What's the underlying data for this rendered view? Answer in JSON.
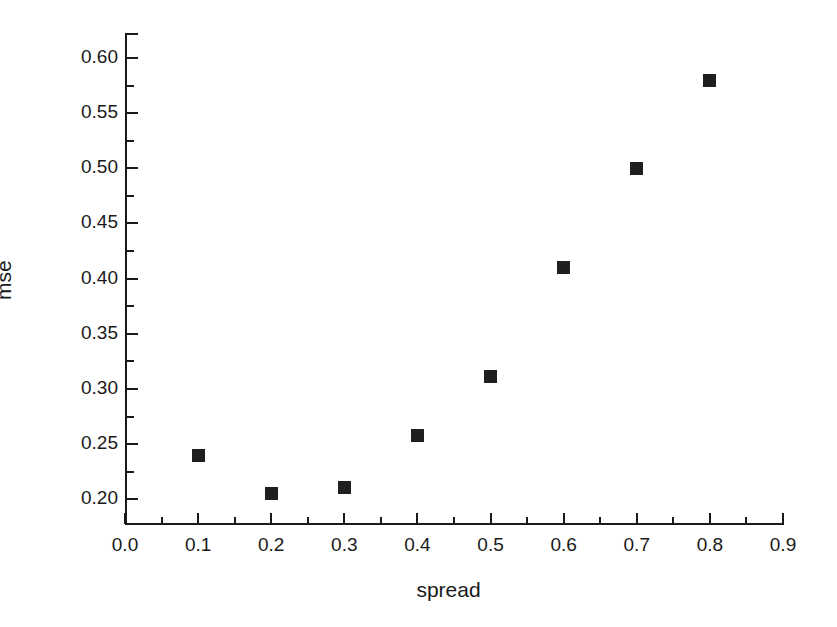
{
  "chart_data": {
    "type": "scatter",
    "title": "",
    "xlabel": "spread",
    "ylabel": "mse",
    "x": [
      0.1,
      0.2,
      0.3,
      0.4,
      0.5,
      0.6,
      0.7,
      0.8
    ],
    "values": [
      0.24,
      0.205,
      0.211,
      0.258,
      0.311,
      0.41,
      0.5,
      0.58
    ],
    "series": [
      {
        "name": "mse",
        "points": [
          {
            "x": 0.1,
            "y": 0.24
          },
          {
            "x": 0.2,
            "y": 0.205
          },
          {
            "x": 0.3,
            "y": 0.211
          },
          {
            "x": 0.4,
            "y": 0.258
          },
          {
            "x": 0.5,
            "y": 0.311
          },
          {
            "x": 0.6,
            "y": 0.41
          },
          {
            "x": 0.7,
            "y": 0.5
          },
          {
            "x": 0.8,
            "y": 0.58
          }
        ],
        "marker": "filled-square",
        "color": "#1f1f1f"
      }
    ],
    "xlim": [
      0.0,
      0.9
    ],
    "ylim": [
      0.1777,
      0.6226
    ],
    "xticks": [
      0.0,
      0.1,
      0.2,
      0.3,
      0.4,
      0.5,
      0.6,
      0.7,
      0.8,
      0.9
    ],
    "xticklabels": [
      "0.0",
      "0.1",
      "0.2",
      "0.3",
      "0.4",
      "0.5",
      "0.6",
      "0.7",
      "0.8",
      "0.9"
    ],
    "xminorticks": [
      0.05,
      0.15,
      0.25,
      0.35,
      0.45,
      0.55,
      0.65,
      0.75,
      0.85
    ],
    "yticks": [
      0.2,
      0.25,
      0.3,
      0.35,
      0.4,
      0.45,
      0.5,
      0.55,
      0.6
    ],
    "yticklabels": [
      "0.20",
      "0.25",
      "0.30",
      "0.35",
      "0.40",
      "0.45",
      "0.50",
      "0.55",
      "0.60"
    ],
    "yminorticks": [
      0.225,
      0.275,
      0.325,
      0.375,
      0.425,
      0.475,
      0.525,
      0.575
    ],
    "grid": false,
    "legend": null,
    "legend_position": "none",
    "background_color": "#ffffff",
    "axis_color": "#1a1a1a"
  }
}
